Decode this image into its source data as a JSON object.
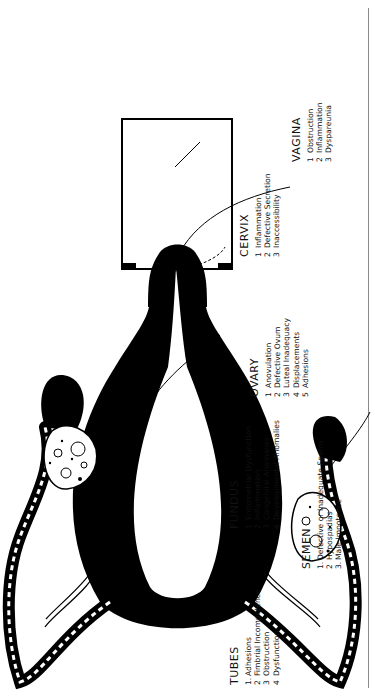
{
  "diagram": {
    "colors": {
      "ink": "#000000",
      "background": "#ffffff",
      "border": "#8a8a8a"
    },
    "labels": {
      "ovary": {
        "title": "OVARY",
        "items": [
          {
            "num": "1",
            "text": "Anovulation"
          },
          {
            "num": "2",
            "text": "Defective Ovum"
          },
          {
            "num": "3",
            "text": "Luteal Inadequacy"
          },
          {
            "num": "4",
            "text": "Displacements"
          },
          {
            "num": "5",
            "text": "Adhesions"
          }
        ]
      },
      "cervix": {
        "title": "CERVIX",
        "items": [
          {
            "num": "1",
            "text": "Inflammation"
          },
          {
            "num": "2",
            "text": "Defective Secretion"
          },
          {
            "num": "3",
            "text": "Inaccessibility"
          }
        ]
      },
      "vagina": {
        "title": "VAGINA",
        "items": [
          {
            "num": "1",
            "text": "Obstruction"
          },
          {
            "num": "2",
            "text": "Inflammation"
          },
          {
            "num": "3",
            "text": "Dyspareunia"
          }
        ]
      },
      "fundus": {
        "title": "FUNDUS",
        "items": [
          {
            "num": "1",
            "text": "Endometrial Dysfunction"
          },
          {
            "num": "2",
            "text": "Inflammation"
          },
          {
            "num": "3",
            "text": "Congenital Anomalies"
          },
          {
            "num": "4",
            "text": "Developmental Anomalies"
          }
        ]
      },
      "semen": {
        "title": "SEMEN",
        "items": [
          {
            "num": "1.",
            "text": "Defective or Inadequate Sperm"
          },
          {
            "num": "2",
            "text": "Hypospadias"
          },
          {
            "num": "3.",
            "text": "Male Impotence"
          }
        ]
      },
      "tubes": {
        "title": "TUBES",
        "items": [
          {
            "num": "1.",
            "text": "Adhesions"
          },
          {
            "num": "2",
            "text": "Fimbrial Incompetence"
          },
          {
            "num": "3",
            "text": "Obstruction"
          },
          {
            "num": "4",
            "text": "Dysfunction"
          }
        ]
      }
    }
  }
}
